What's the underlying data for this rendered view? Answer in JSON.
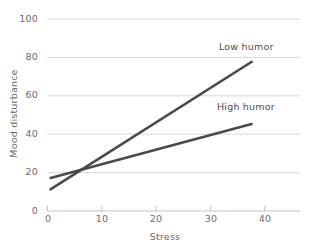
{
  "chart_data": {
    "type": "line",
    "title": "",
    "subtitle": "",
    "xlabel": "Stress",
    "ylabel": "Mood disturbance",
    "xlim": [
      0,
      48
    ],
    "ylim": [
      0,
      100
    ],
    "xticks": [
      0,
      10,
      20,
      30,
      40
    ],
    "xtick_labels": [
      "0",
      "10",
      "20",
      "30",
      "40"
    ],
    "yticks": [
      0,
      20,
      40,
      60,
      80,
      100
    ],
    "ytick_labels": [
      "0",
      "20",
      "40",
      "60",
      "80",
      "100"
    ],
    "grid": "horizontal",
    "legend_position": "inline-annotations",
    "series": [
      {
        "name": "Low humor",
        "color": "#4a4a4a",
        "x": [
          0.5,
          39
        ],
        "values": [
          11,
          78
        ],
        "annotation": "Low humor"
      },
      {
        "name": "High humor",
        "color": "#4a4a4a",
        "x": [
          0.5,
          39
        ],
        "values": [
          17,
          45.5
        ],
        "annotation": "High humor"
      }
    ],
    "intersection": {
      "x": 6,
      "y": 22
    },
    "colors": {
      "line": "#4a4a4a",
      "gridline": "#d8d8d8",
      "axis": "#b8b8b8",
      "text": "#6b6b6b",
      "background": "#ffffff"
    }
  },
  "axes": {
    "x_title": "Stress",
    "y_title": "Mood disturbance",
    "x_tick_0": "0",
    "x_tick_1": "10",
    "x_tick_2": "20",
    "x_tick_3": "30",
    "x_tick_4": "40",
    "y_tick_0": "0",
    "y_tick_1": "20",
    "y_tick_2": "40",
    "y_tick_3": "60",
    "y_tick_4": "80",
    "y_tick_5": "100"
  },
  "annotations": {
    "low_humor": "Low humor",
    "high_humor": "High humor"
  }
}
